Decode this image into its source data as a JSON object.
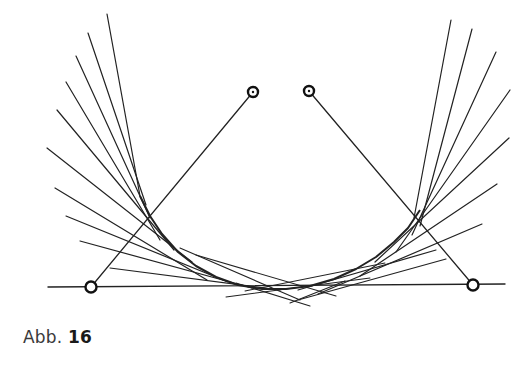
{
  "figure": {
    "caption_prefix": "Abb.",
    "caption_number": "16",
    "stroke_color": "#222222",
    "baseline": {
      "x1": 48,
      "y1": 287,
      "x2": 505,
      "y2": 284
    },
    "control_points": [
      {
        "name": "start-point",
        "x": 91,
        "y": 287,
        "dotted": false
      },
      {
        "name": "control-point-1",
        "x": 253,
        "y": 92,
        "dotted": true
      },
      {
        "name": "control-point-2",
        "x": 309,
        "y": 91,
        "dotted": true
      },
      {
        "name": "end-point",
        "x": 473,
        "y": 285,
        "dotted": false
      }
    ],
    "control_polygon": [
      {
        "x1": 91,
        "y1": 287,
        "x2": 253,
        "y2": 92
      },
      {
        "x1": 309,
        "y1": 91,
        "x2": 473,
        "y2": 285
      }
    ],
    "tangent_lines_left": [
      {
        "x1": 107,
        "y1": 14,
        "x2": 140,
        "y2": 196
      },
      {
        "x1": 88,
        "y1": 33,
        "x2": 146,
        "y2": 205
      },
      {
        "x1": 76,
        "y1": 56,
        "x2": 150,
        "y2": 218
      },
      {
        "x1": 66,
        "y1": 82,
        "x2": 160,
        "y2": 240
      },
      {
        "x1": 57,
        "y1": 110,
        "x2": 174,
        "y2": 250
      },
      {
        "x1": 47,
        "y1": 148,
        "x2": 192,
        "y2": 262
      },
      {
        "x1": 55,
        "y1": 188,
        "x2": 207,
        "y2": 280
      },
      {
        "x1": 66,
        "y1": 216,
        "x2": 228,
        "y2": 282
      },
      {
        "x1": 80,
        "y1": 241,
        "x2": 252,
        "y2": 288
      },
      {
        "x1": 110,
        "y1": 268,
        "x2": 280,
        "y2": 290
      }
    ],
    "tangent_lines_right": [
      {
        "x1": 451,
        "y1": 20,
        "x2": 414,
        "y2": 218
      },
      {
        "x1": 472,
        "y1": 29,
        "x2": 420,
        "y2": 226
      },
      {
        "x1": 496,
        "y1": 52,
        "x2": 412,
        "y2": 235
      },
      {
        "x1": 510,
        "y1": 90,
        "x2": 396,
        "y2": 252
      },
      {
        "x1": 509,
        "y1": 138,
        "x2": 375,
        "y2": 262
      },
      {
        "x1": 497,
        "y1": 184,
        "x2": 360,
        "y2": 276
      },
      {
        "x1": 482,
        "y1": 224,
        "x2": 318,
        "y2": 294
      },
      {
        "x1": 446,
        "y1": 259,
        "x2": 298,
        "y2": 300
      },
      {
        "x1": 436,
        "y1": 250,
        "x2": 298,
        "y2": 290
      }
    ],
    "tangent_lines_bottom": [
      {
        "x1": 196,
        "y1": 255,
        "x2": 336,
        "y2": 296
      },
      {
        "x1": 226,
        "y1": 297,
        "x2": 370,
        "y2": 278
      },
      {
        "x1": 236,
        "y1": 283,
        "x2": 310,
        "y2": 306
      },
      {
        "x1": 290,
        "y1": 303,
        "x2": 345,
        "y2": 281
      },
      {
        "x1": 245,
        "y1": 291,
        "x2": 385,
        "y2": 263
      },
      {
        "x1": 180,
        "y1": 248,
        "x2": 300,
        "y2": 300
      }
    ],
    "envelope_curve": {
      "p0": {
        "x": 91,
        "y": 287
      },
      "p1": {
        "x": 253,
        "y": 92
      },
      "p2": {
        "x": 309,
        "y": 91
      },
      "p3": {
        "x": 473,
        "y": 285
      },
      "note_visible": false
    },
    "envelope_path_points": [
      [
        140,
        196
      ],
      [
        150,
        216
      ],
      [
        162,
        234
      ],
      [
        178,
        252
      ],
      [
        196,
        266
      ],
      [
        216,
        277
      ],
      [
        238,
        285
      ],
      [
        262,
        289
      ],
      [
        286,
        289
      ],
      [
        310,
        286
      ],
      [
        334,
        279
      ],
      [
        356,
        269
      ],
      [
        376,
        257
      ],
      [
        394,
        242
      ],
      [
        408,
        228
      ],
      [
        420,
        210
      ]
    ]
  }
}
